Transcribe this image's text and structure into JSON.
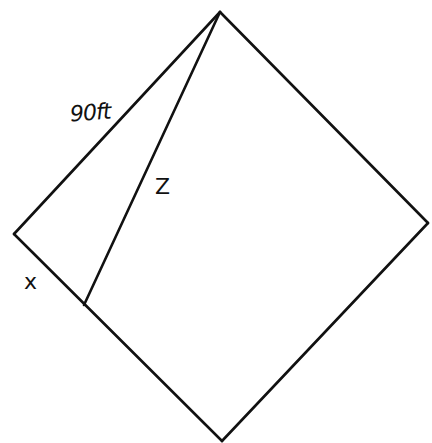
{
  "diagram": {
    "type": "geometry",
    "shape": "square rotated (diamond) with segment from top vertex to point on lower-left side",
    "stroke_color": "#111111",
    "background": "#ffffff",
    "vertices": {
      "top": [
        220,
        12
      ],
      "left": [
        14,
        234
      ],
      "right": [
        428,
        223
      ],
      "bottom": [
        222,
        441
      ],
      "z_foot": [
        84,
        305
      ]
    },
    "labels": {
      "side": "90ft",
      "segment": "Z",
      "partial_side": "x"
    }
  }
}
